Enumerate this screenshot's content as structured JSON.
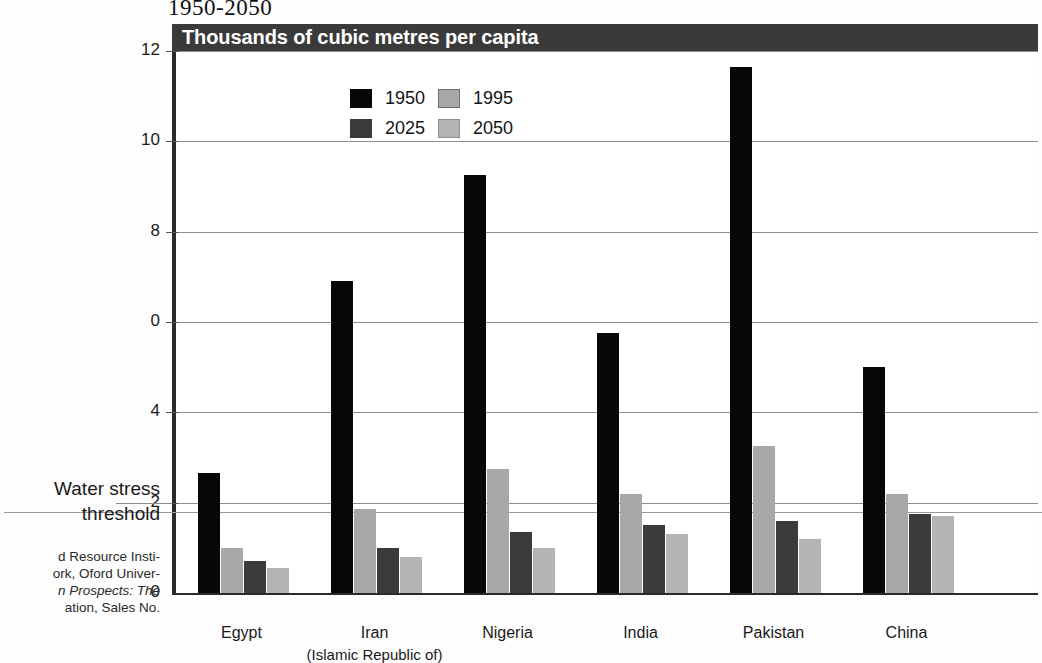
{
  "chart_title": "1950-2050",
  "banner_label": "Thousands of cubic metres per capita",
  "legend": {
    "entries": [
      {
        "key": "s1950",
        "label": "1950",
        "color": "#080808"
      },
      {
        "key": "s1995",
        "label": "1995",
        "color": "#a8a8a8"
      },
      {
        "key": "s2025",
        "label": "2025",
        "color": "#3b3b3b"
      },
      {
        "key": "s2050",
        "label": "2050",
        "color": "#b4b4b4"
      }
    ]
  },
  "annotations": {
    "threshold_line1": "Water stress",
    "threshold_line2": "threshold",
    "source_line1": "d Resource Insti-",
    "source_line2": "ork, Oford Univer-",
    "source_line3": "n Prospects: The",
    "source_line4": "ation, Sales No."
  },
  "chart_data": {
    "type": "bar",
    "title": "1950-2050",
    "subtitle": "Thousands of cubic metres per capita",
    "xlabel": "",
    "ylabel": "Thousands of cubic metres per capita",
    "ylim": [
      0,
      12
    ],
    "yticks": [
      0,
      2,
      4,
      0,
      8,
      10,
      12
    ],
    "ytick_labels": [
      "0",
      "2",
      "4",
      "0",
      "8",
      "10",
      "12"
    ],
    "grid": true,
    "legend_position": "top-left inside plot",
    "threshold": {
      "label": "Water stress threshold",
      "value": 1.8
    },
    "categories": [
      "Egypt",
      "Iran",
      "Nigeria",
      "India",
      "Pakistan",
      "China"
    ],
    "category_sublabels": [
      "",
      "(Islamic Republic of)",
      "",
      "",
      "",
      ""
    ],
    "series": [
      {
        "name": "1950",
        "color": "#080808",
        "values": [
          2.65,
          6.9,
          9.25,
          5.75,
          11.65,
          5.0
        ]
      },
      {
        "name": "1995",
        "color": "#a8a8a8",
        "values": [
          1.0,
          1.85,
          2.75,
          2.2,
          3.25,
          2.2
        ]
      },
      {
        "name": "2025",
        "color": "#3b3b3b",
        "values": [
          0.7,
          1.0,
          1.35,
          1.5,
          1.6,
          1.75
        ]
      },
      {
        "name": "2050",
        "color": "#b4b4b4",
        "values": [
          0.55,
          0.8,
          1.0,
          1.3,
          1.2,
          1.7
        ]
      }
    ]
  }
}
